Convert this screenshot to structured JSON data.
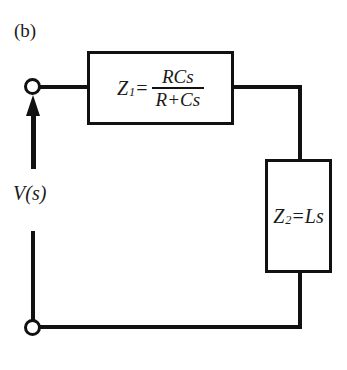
{
  "figure": {
    "panel_label": "(b)",
    "source_label": "V(s)"
  },
  "blocks": [
    {
      "id": "z1",
      "symbol": "Z",
      "subscript": "1",
      "equals": "=",
      "numerator": "RCs",
      "denominator": "R+Cs",
      "expression": "Z_1 = RCs/(R+Cs)"
    },
    {
      "id": "z2",
      "symbol": "Z",
      "subscript": "2",
      "equals": "=",
      "value": "Ls",
      "expression": "Z_2 = Ls"
    }
  ],
  "terminals": [
    {
      "id": "top",
      "style": "open-circle"
    },
    {
      "id": "bottom",
      "style": "open-circle"
    }
  ],
  "source_arrow": {
    "direction": "up",
    "meaning": "voltage-source-arrow"
  },
  "colors": {
    "line": "#111111",
    "text": "#1a1a1a",
    "background": "#ffffff"
  }
}
